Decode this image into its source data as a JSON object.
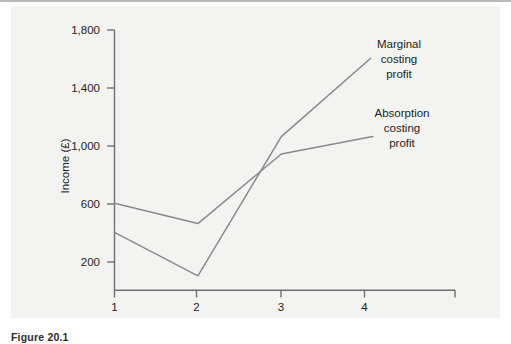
{
  "figure": {
    "caption": "Figure 20.1",
    "background_color": "#f3f3f1",
    "line_color": "#8a8a8a",
    "text_color": "#231f20"
  },
  "chart_data": {
    "type": "line",
    "title": "",
    "xlabel": "Years",
    "ylabel": "Income (£)",
    "x": [
      1,
      2,
      3,
      4
    ],
    "categories": [
      "1",
      "2",
      "3",
      "4"
    ],
    "xtick_labels": [
      "1",
      "2",
      "3",
      "4"
    ],
    "ytick_labels": [
      "200",
      "600",
      "1,000",
      "1,400",
      "1,800"
    ],
    "ytick_values": [
      200,
      600,
      1000,
      1400,
      1800
    ],
    "xlim": [
      1,
      4.1
    ],
    "ylim": [
      0,
      1800
    ],
    "grid": false,
    "legend": "annotations-at-line-ends",
    "series": [
      {
        "name": "Marginal costing profit",
        "label_lines": [
          "Marginal",
          "costing",
          "profit"
        ],
        "values": [
          400,
          100,
          1060,
          1600
        ]
      },
      {
        "name": "Absorption costing profit",
        "label_lines": [
          "Absorption",
          "costing",
          "profit"
        ],
        "values": [
          600,
          460,
          940,
          1060
        ]
      }
    ]
  }
}
